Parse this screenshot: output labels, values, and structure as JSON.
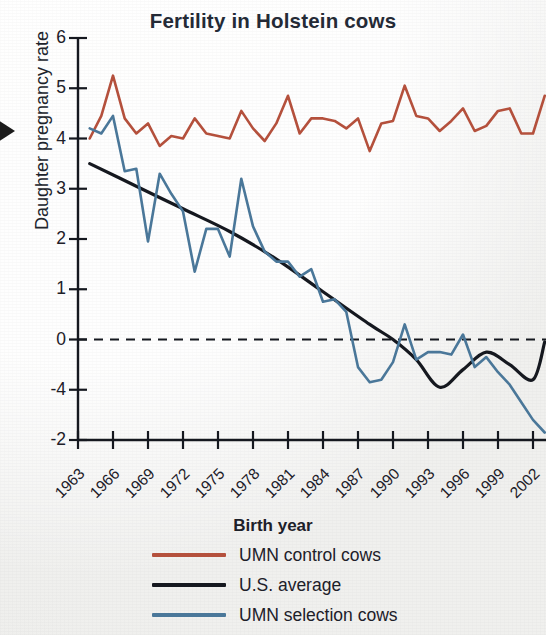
{
  "chart_data": {
    "type": "line",
    "title": "Fertility in Holstein cows",
    "xlabel": "Birth year",
    "ylabel": "Daughter pregnancy rate",
    "xticks": [
      "1963",
      "1966",
      "1969",
      "1972",
      "1975",
      "1978",
      "1981",
      "1984",
      "1987",
      "1990",
      "1993",
      "1996",
      "1999",
      "2002"
    ],
    "yticks": [
      "6",
      "5",
      "4",
      "3",
      "2",
      "1",
      "0",
      "-4",
      "-2"
    ],
    "ytick_values": [
      6,
      5,
      4,
      3,
      2,
      1,
      0,
      -1,
      -2
    ],
    "xlim": [
      1963,
      2004
    ],
    "ylim": [
      -2,
      6
    ],
    "grid": false,
    "zero_reference_line": {
      "value": 0,
      "style": "dashed",
      "color": "#15181f"
    },
    "legend_position": "bottom",
    "series": [
      {
        "name": "UMN control cows",
        "color": "#b4503c",
        "x": [
          1964,
          1965,
          1966,
          1967,
          1968,
          1969,
          1970,
          1971,
          1972,
          1973,
          1974,
          1975,
          1976,
          1977,
          1978,
          1979,
          1980,
          1981,
          1982,
          1983,
          1984,
          1985,
          1986,
          1987,
          1988,
          1989,
          1990,
          1991,
          1992,
          1993,
          1994,
          1995,
          1996,
          1997,
          1998,
          1999,
          2000,
          2001,
          2002,
          2003
        ],
        "y": [
          4.0,
          4.45,
          5.25,
          4.4,
          4.1,
          4.3,
          3.85,
          4.05,
          4.0,
          4.4,
          4.1,
          4.05,
          4.0,
          4.55,
          4.2,
          3.95,
          4.3,
          4.85,
          4.1,
          4.4,
          4.4,
          4.35,
          4.2,
          4.4,
          3.75,
          4.3,
          4.35,
          5.05,
          4.45,
          4.4,
          4.15,
          4.35,
          4.6,
          4.15,
          4.25,
          4.55,
          4.6,
          4.1,
          4.1,
          4.85
        ]
      },
      {
        "name": "U.S. average",
        "color": "#15181f",
        "x": [
          1964,
          1968,
          1972,
          1976,
          1980,
          1984,
          1988,
          1990,
          1992,
          1994,
          1996,
          1998,
          2000,
          2002,
          2003
        ],
        "y": [
          3.5,
          3.05,
          2.6,
          2.15,
          1.6,
          0.95,
          0.3,
          0.0,
          -0.4,
          -0.95,
          -0.6,
          -0.25,
          -0.5,
          -0.8,
          -0.05
        ]
      },
      {
        "name": "UMN selection cows",
        "color": "#4a7799",
        "x": [
          1964,
          1965,
          1966,
          1967,
          1968,
          1969,
          1970,
          1971,
          1972,
          1973,
          1974,
          1975,
          1976,
          1977,
          1978,
          1979,
          1980,
          1981,
          1982,
          1983,
          1984,
          1985,
          1986,
          1987,
          1988,
          1989,
          1990,
          1991,
          1992,
          1993,
          1994,
          1995,
          1996,
          1997,
          1998,
          1999,
          2000,
          2001,
          2002,
          2003
        ],
        "y": [
          4.2,
          4.1,
          4.45,
          3.35,
          3.4,
          1.95,
          3.3,
          2.9,
          2.55,
          1.35,
          2.2,
          2.2,
          1.65,
          3.2,
          2.25,
          1.75,
          1.55,
          1.55,
          1.25,
          1.4,
          0.75,
          0.8,
          0.55,
          -0.55,
          -0.85,
          -0.8,
          -0.45,
          0.3,
          -0.4,
          -0.25,
          -0.25,
          -0.3,
          0.1,
          -0.55,
          -0.35,
          -0.65,
          -0.9,
          -1.25,
          -1.6,
          -1.85
        ]
      }
    ]
  },
  "legend": {
    "items": [
      {
        "label": "UMN control cows",
        "color": "#b4503c"
      },
      {
        "label": "U.S. average",
        "color": "#15181f"
      },
      {
        "label": "UMN selection cows",
        "color": "#4a7799"
      }
    ]
  }
}
